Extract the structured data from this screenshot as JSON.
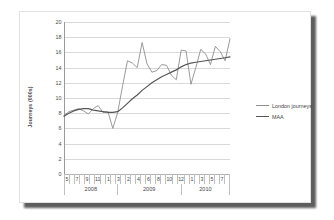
{
  "chart_data": {
    "type": "line",
    "title": "",
    "xlabel": "",
    "ylabel": "Journeys (000s)",
    "ylim": [
      0,
      20
    ],
    "ytick_step": 2,
    "yticks": [
      "0",
      "2",
      "4",
      "6",
      "8",
      "10",
      "12",
      "14",
      "16",
      "18",
      "20"
    ],
    "grid": true,
    "legend_position": "right",
    "x_tick_labels": [
      "5",
      "",
      "7",
      "",
      "9",
      "",
      "11",
      "",
      "1",
      "",
      "3",
      "",
      "2",
      "",
      "4",
      "",
      "6",
      "",
      "8",
      "",
      "10",
      "",
      "12",
      "",
      "1",
      "",
      "3",
      "",
      "5",
      "",
      "7",
      ""
    ],
    "x_tick_labels_visible": [
      "5",
      "7",
      "9",
      "11",
      "1",
      "3",
      "2",
      "4",
      "6",
      "8",
      "10",
      "12",
      "1",
      "3",
      "5",
      "7"
    ],
    "year_groups": [
      {
        "label": "2008",
        "span": 10
      },
      {
        "label": "2009",
        "span": 12
      },
      {
        "label": "2010",
        "span": 9
      }
    ],
    "x_months": [
      "5",
      "6",
      "7",
      "8",
      "9",
      "10",
      "11",
      "12",
      "1",
      "2",
      "3",
      "4",
      "5",
      "6",
      "7",
      "8",
      "9",
      "10",
      "11",
      "12",
      "1",
      "2",
      "3",
      "4",
      "5",
      "6",
      "7",
      "8",
      "9",
      "10",
      "11"
    ],
    "series": [
      {
        "name": "London journeys",
        "color": "#8e8e8e",
        "values": [
          7.7,
          8.2,
          8.4,
          8.6,
          8.3,
          7.9,
          8.6,
          9.0,
          8.1,
          8.2,
          6.0,
          8.1,
          11.6,
          14.9,
          14.6,
          14.0,
          17.3,
          14.5,
          13.4,
          13.6,
          14.4,
          14.3,
          13.0,
          12.4,
          16.3,
          16.2,
          11.8,
          14.0,
          16.4,
          15.8,
          14.4,
          16.8,
          16.1,
          14.9,
          17.8
        ]
      },
      {
        "name": "MAA",
        "color": "#565656",
        "values": [
          7.6,
          8.0,
          8.3,
          8.5,
          8.6,
          8.6,
          8.4,
          8.3,
          8.2,
          8.1,
          8.1,
          8.2,
          8.7,
          9.3,
          9.9,
          10.4,
          11.0,
          11.5,
          12.0,
          12.4,
          12.8,
          13.1,
          13.4,
          13.7,
          14.1,
          14.4,
          14.6,
          14.7,
          14.8,
          14.9,
          15.0,
          15.1,
          15.2,
          15.3,
          15.4
        ]
      }
    ]
  },
  "legend": {
    "items": [
      {
        "label": "London journeys"
      },
      {
        "label": "MAA"
      }
    ]
  }
}
